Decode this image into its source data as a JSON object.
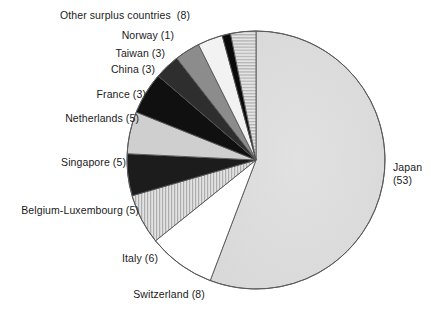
{
  "chart_data": {
    "type": "pie",
    "title": "",
    "subtitle": "",
    "xlabel": "",
    "ylabel": "",
    "legend_position": "none",
    "grid": false,
    "total": 95,
    "start_angle_deg": 0,
    "direction": "clockwise",
    "center": {
      "x": 256,
      "y": 160
    },
    "radius": 129,
    "categories": [
      "Japan",
      "Switzerland",
      "Italy",
      "Belgium-Luxembourg",
      "Singapore",
      "Netherlands",
      "France",
      "China",
      "Taiwan",
      "Norway",
      "Other surplus countries"
    ],
    "values": [
      53,
      8,
      6,
      5,
      5,
      5,
      3,
      3,
      3,
      1,
      8
    ],
    "slices": [
      {
        "name": "Japan",
        "value": 53,
        "value_text": "(53)",
        "label": "Japan",
        "label_line1": "Japan",
        "label_line2": "(53)",
        "fill": "#dcdcdc",
        "pattern": "none",
        "start_deg": 0,
        "end_deg": 200.8
      },
      {
        "name": "Switzerland",
        "value": 8,
        "value_text": "(8)",
        "label": "Switzerland (8)",
        "fill": "#ffffff",
        "pattern": "none",
        "start_deg": 200.8,
        "end_deg": 231.2
      },
      {
        "name": "Italy",
        "value": 6,
        "value_text": "(6)",
        "label": "Italy (6)",
        "fill": "#d2d2d2",
        "pattern": "vertical-lines",
        "start_deg": 231.2,
        "end_deg": 253.9
      },
      {
        "name": "Belgium-Luxembourg",
        "value": 5,
        "value_text": "(5)",
        "label": "Belgium-Luxembourg (5)",
        "fill": "#1c1c1c",
        "pattern": "none",
        "start_deg": 253.9,
        "end_deg": 272.8
      },
      {
        "name": "Singapore",
        "value": 5,
        "value_text": "(5)",
        "label": "Singapore (5)",
        "fill": "#cfcfcf",
        "pattern": "none",
        "start_deg": 272.8,
        "end_deg": 291.8
      },
      {
        "name": "Netherlands",
        "value": 5,
        "value_text": "(5)",
        "label": "Netherlands (5)",
        "fill": "#101010",
        "pattern": "none",
        "start_deg": 291.8,
        "end_deg": 310.7
      },
      {
        "name": "France",
        "value": 3,
        "value_text": "(3)",
        "label": "France (3)",
        "fill": "#2e2e2e",
        "pattern": "none",
        "start_deg": 310.7,
        "end_deg": 322.1
      },
      {
        "name": "China",
        "value": 3,
        "value_text": "(3)",
        "label": "China (3)",
        "fill": "#8c8c8c",
        "pattern": "none",
        "start_deg": 322.1,
        "end_deg": 333.5
      },
      {
        "name": "Taiwan",
        "value": 3,
        "value_text": "(3)",
        "label": "Taiwan (3)",
        "fill": "#f2f2f2",
        "pattern": "none",
        "start_deg": 333.5,
        "end_deg": 344.8
      },
      {
        "name": "Norway",
        "value": 1,
        "value_text": "(1)",
        "label": "Norway (1)",
        "fill": "#0a0a0a",
        "pattern": "none",
        "start_deg": 344.8,
        "end_deg": 348.6
      },
      {
        "name": "Other surplus countries",
        "value": 8,
        "value_text": "(8)",
        "label": "Other surplus countries  (8)",
        "fill": "#d8d8d8",
        "pattern": "horizontal-lines",
        "start_deg": 348.6,
        "end_deg": 360
      }
    ],
    "colors": {
      "outline": "#555555",
      "text": "#1a1a1a",
      "background": "#ffffff"
    }
  },
  "labels": {
    "other_surplus": "Other surplus countries  (8)",
    "norway": "Norway (1)",
    "taiwan": "Taiwan (3)",
    "china": "China (3)",
    "france": "France (3)",
    "netherlands": "Netherlands (5)",
    "singapore": "Singapore (5)",
    "belgium_luxembourg": "Belgium-Luxembourg (5)",
    "italy": "Italy (6)",
    "switzerland": "Switzerland (8)",
    "japan_name": "Japan",
    "japan_value": "(53)"
  }
}
